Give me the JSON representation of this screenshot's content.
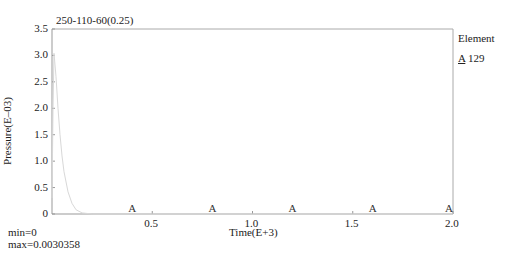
{
  "chart_data": {
    "type": "line",
    "title": "250-110-60(0.25)",
    "xlabel": "Time(E+3)",
    "ylabel": "Pressure(E–03)",
    "xlim": [
      0,
      2.0
    ],
    "ylim": [
      0,
      3.5
    ],
    "x_ticks": [
      "0.5",
      "1.0",
      "1.5",
      "2.0"
    ],
    "y_ticks": [
      "0",
      "0.5",
      "1.0",
      "1.5",
      "2.0",
      "2.5",
      "3.0",
      "3.5"
    ],
    "grid": false,
    "legend": {
      "title": "Element",
      "position": "right",
      "entries": [
        {
          "marker": "A",
          "label": "129"
        }
      ]
    },
    "series": [
      {
        "name": "A 129",
        "x": [
          0,
          0.005,
          0.01,
          0.02,
          0.03,
          0.04,
          0.05,
          0.06,
          0.08,
          0.1,
          0.12,
          0.15,
          0.2,
          0.4,
          0.8,
          1.2,
          1.6,
          2.0
        ],
        "y": [
          0.3,
          2.0,
          3.04,
          2.6,
          2.0,
          1.5,
          1.1,
          0.8,
          0.42,
          0.2,
          0.08,
          0.02,
          0,
          0,
          0,
          0,
          0,
          0
        ]
      }
    ],
    "stats": {
      "min": "0",
      "max": "0.0030358"
    }
  },
  "labels": {
    "title": "250-110-60(0.25)",
    "xlabel": "Time(E+3)",
    "ylabel": "Pressure(E–03)",
    "legend_title": "Element",
    "legend_marker": "A",
    "legend_label": "129",
    "min": "min=0",
    "max": "max=0.0030358",
    "marker": "A"
  }
}
